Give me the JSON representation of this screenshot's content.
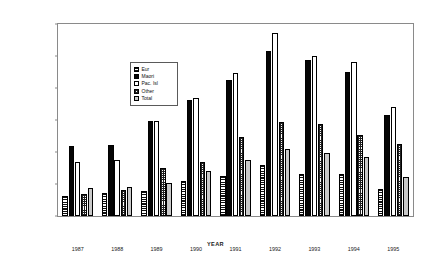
{
  "chart_data": {
    "type": "bar",
    "title": "",
    "xlabel": "YEAR",
    "ylabel": "PERCENTAGE",
    "categories": [
      "1987",
      "1988",
      "1989",
      "1990",
      "1991",
      "1992",
      "1993",
      "1994",
      "1995"
    ],
    "ylim": [
      0,
      30
    ],
    "yticks": [
      "0",
      "5.0",
      "10.0",
      "15.0",
      "20.0",
      "25.0",
      "30.0"
    ],
    "ytick_values": [
      0,
      5,
      10,
      15,
      20,
      25,
      30
    ],
    "grid": false,
    "legend_position": "upper-left",
    "series": [
      {
        "name": "Eur",
        "values": [
          3.2,
          3.6,
          3.9,
          5.5,
          6.3,
          7.9,
          6.5,
          6.6,
          4.2
        ]
      },
      {
        "name": "Maori",
        "values": [
          11.0,
          11.1,
          14.9,
          18.2,
          21.2,
          25.8,
          24.4,
          22.5,
          15.8
        ]
      },
      {
        "name": "Pac. Isl",
        "values": [
          8.4,
          8.7,
          14.9,
          18.4,
          22.4,
          28.6,
          25.0,
          24.0,
          17.0
        ]
      },
      {
        "name": "Other",
        "values": [
          3.5,
          4.1,
          7.5,
          8.4,
          12.3,
          14.7,
          14.4,
          12.6,
          11.3
        ]
      },
      {
        "name": "Total",
        "values": [
          4.3,
          4.6,
          5.2,
          7.1,
          8.7,
          10.5,
          9.9,
          9.2,
          6.1
        ]
      }
    ]
  },
  "legend": {
    "items": [
      {
        "label": "Eur",
        "swatch": "hatch-horizontal"
      },
      {
        "label": "Maori",
        "swatch": "solid-black"
      },
      {
        "label": "Pac. Isl",
        "swatch": "solid-white"
      },
      {
        "label": "Other",
        "swatch": "hatch-grid"
      },
      {
        "label": "Total",
        "swatch": "solid-gray"
      }
    ]
  },
  "colors": {
    "axis": "#8a8a8a",
    "text": "#1a1a1a",
    "maori": "#050505",
    "pac": "#ffffff",
    "total": "#c9c9c9"
  }
}
